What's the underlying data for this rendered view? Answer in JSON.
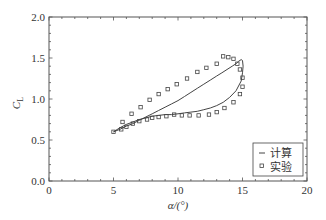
{
  "chart_data": {
    "type": "line",
    "title": "",
    "xlabel": "α/(°)",
    "ylabel": "C_L",
    "ylabel_main": "C",
    "ylabel_sub": "L",
    "xlim": [
      0,
      20
    ],
    "ylim": [
      0.0,
      2.0
    ],
    "xticks": [
      0,
      5,
      10,
      15,
      20
    ],
    "xtick_labels": [
      "0",
      "5",
      "10",
      "15",
      "20"
    ],
    "yticks": [
      0.0,
      0.5,
      1.0,
      1.5,
      2.0
    ],
    "ytick_labels": [
      "0.0",
      "0.5",
      "1.0",
      "1.5",
      "2.0"
    ],
    "grid": false,
    "legend_position": "lower right",
    "series": [
      {
        "name": "计算",
        "style": "line",
        "color": "#444444",
        "x": [
          5.0,
          5.5,
          6.0,
          6.5,
          7.0,
          7.5,
          8.0,
          8.5,
          9.0,
          9.5,
          10.0,
          10.5,
          11.0,
          11.5,
          12.0,
          12.5,
          13.0,
          13.5,
          14.0,
          14.5,
          14.9,
          15.0,
          15.05,
          15.0,
          14.9,
          14.7,
          14.5,
          14.2,
          13.8,
          13.4,
          13.0,
          12.5,
          12.0,
          11.5,
          11.0,
          10.5,
          10.0,
          9.5,
          9.0,
          8.5,
          8.0,
          7.5,
          7.0,
          6.5,
          6.0,
          5.5,
          5.0
        ],
        "y": [
          0.6,
          0.65,
          0.69,
          0.72,
          0.75,
          0.77,
          0.79,
          0.8,
          0.81,
          0.81,
          0.82,
          0.83,
          0.84,
          0.85,
          0.87,
          0.89,
          0.92,
          0.96,
          1.02,
          1.1,
          1.22,
          1.32,
          1.4,
          1.47,
          1.48,
          1.46,
          1.43,
          1.4,
          1.36,
          1.32,
          1.28,
          1.23,
          1.18,
          1.13,
          1.08,
          1.03,
          0.98,
          0.94,
          0.9,
          0.86,
          0.82,
          0.78,
          0.74,
          0.7,
          0.67,
          0.63,
          0.6
        ]
      },
      {
        "name": "实验",
        "style": "markers",
        "marker": "open-square",
        "color": "#444444",
        "x": [
          5.0,
          5.6,
          6.0,
          6.5,
          7.0,
          7.6,
          8.0,
          8.5,
          9.1,
          9.7,
          10.3,
          10.9,
          11.6,
          12.4,
          13.0,
          13.6,
          14.3,
          14.8,
          15.0,
          15.0,
          14.8,
          14.6,
          14.3,
          13.9,
          13.5,
          13.0,
          12.2,
          11.5,
          10.7,
          9.9,
          9.2,
          8.5,
          7.8,
          7.1,
          6.4,
          5.7
        ],
        "y": [
          0.6,
          0.63,
          0.66,
          0.7,
          0.73,
          0.75,
          0.77,
          0.78,
          0.79,
          0.81,
          0.8,
          0.8,
          0.8,
          0.81,
          0.84,
          0.89,
          0.96,
          1.06,
          1.15,
          1.26,
          1.36,
          1.43,
          1.49,
          1.51,
          1.52,
          1.43,
          1.38,
          1.33,
          1.25,
          1.18,
          1.12,
          1.06,
          0.99,
          0.9,
          0.82,
          0.72
        ]
      }
    ]
  },
  "legend": {
    "items": [
      {
        "label": "计算",
        "symbol": "line"
      },
      {
        "label": "实验",
        "symbol": "open-square"
      }
    ]
  }
}
